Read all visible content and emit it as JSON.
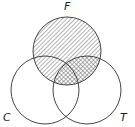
{
  "diagram": {
    "type": "venn",
    "sets": [
      {
        "label": "F",
        "cx": 67,
        "cy": 51,
        "r": 34,
        "label_x": 64,
        "label_y": 10
      },
      {
        "label": "C",
        "cx": 45,
        "cy": 90,
        "r": 34,
        "label_x": 3,
        "label_y": 121
      },
      {
        "label": "T",
        "cx": 87,
        "cy": 90,
        "r": 34,
        "label_x": 120,
        "label_y": 121
      }
    ],
    "shading": {
      "hatched": "F",
      "cross_hatched": "F ∩ T"
    },
    "colors": {
      "stroke": "#333333",
      "background": "#ffffff"
    }
  }
}
